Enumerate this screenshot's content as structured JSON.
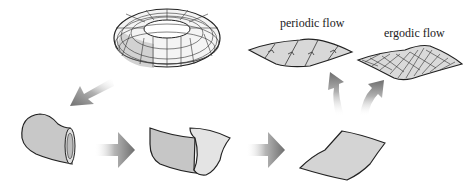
{
  "diagram": {
    "stages": [
      {
        "id": "torus",
        "name": "torus"
      },
      {
        "id": "tube",
        "name": "cut tube"
      },
      {
        "id": "opened-sheet",
        "name": "opened sheet"
      },
      {
        "id": "flat-sheet",
        "name": "flat sheet"
      },
      {
        "id": "periodic",
        "name": "periodic flow sheet"
      },
      {
        "id": "ergodic",
        "name": "ergodic flow sheet"
      }
    ],
    "labels": {
      "periodic": "periodic flow",
      "ergodic": "ergodic flow"
    },
    "colors": {
      "surface_fill": "#cfcfcf",
      "surface_light": "#e6e6e6",
      "outline": "#222222",
      "arrow_dark": "#7a7a7a"
    }
  }
}
